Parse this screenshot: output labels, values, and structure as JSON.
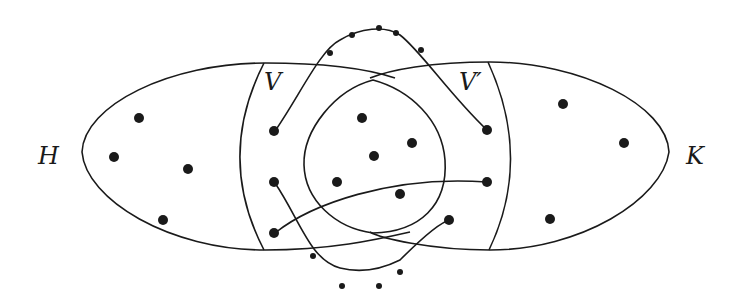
{
  "diagram": {
    "labels": {
      "H": "H",
      "K": "K",
      "V": "V",
      "V_prime": "V′"
    },
    "colors": {
      "stroke": "#1a1a1a",
      "background": "#ffffff"
    },
    "sets": [
      "H",
      "K",
      "V",
      "V′"
    ],
    "vertex_counts": {
      "H_only": 4,
      "V_region": 2,
      "inner_overlap": 5,
      "V_prime_region": 3,
      "K_only": 3
    }
  }
}
